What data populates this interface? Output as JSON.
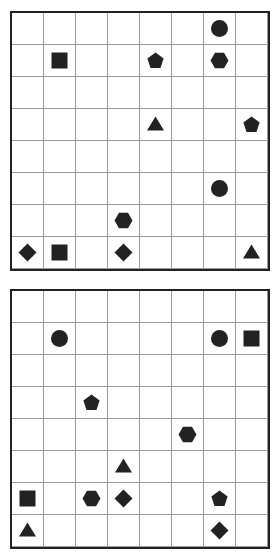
{
  "grid": {
    "rows": 8,
    "cols": 8,
    "cell_px": 32
  },
  "colors": {
    "piece": "#222222",
    "grid_line": "#9a9a9a",
    "border": "#222222",
    "background": "#ffffff"
  },
  "boards": [
    {
      "name": "top-board",
      "pieces": [
        {
          "row": 0,
          "col": 6,
          "shape": "circle"
        },
        {
          "row": 1,
          "col": 1,
          "shape": "square"
        },
        {
          "row": 1,
          "col": 4,
          "shape": "pentagon"
        },
        {
          "row": 1,
          "col": 6,
          "shape": "hexagon"
        },
        {
          "row": 3,
          "col": 4,
          "shape": "triangle"
        },
        {
          "row": 3,
          "col": 7,
          "shape": "pentagon"
        },
        {
          "row": 5,
          "col": 6,
          "shape": "circle"
        },
        {
          "row": 6,
          "col": 3,
          "shape": "hexagon"
        },
        {
          "row": 7,
          "col": 0,
          "shape": "diamond"
        },
        {
          "row": 7,
          "col": 1,
          "shape": "square"
        },
        {
          "row": 7,
          "col": 3,
          "shape": "diamond"
        },
        {
          "row": 7,
          "col": 7,
          "shape": "triangle"
        }
      ]
    },
    {
      "name": "bottom-board",
      "pieces": [
        {
          "row": 1,
          "col": 1,
          "shape": "circle"
        },
        {
          "row": 1,
          "col": 6,
          "shape": "circle"
        },
        {
          "row": 1,
          "col": 7,
          "shape": "square"
        },
        {
          "row": 3,
          "col": 2,
          "shape": "pentagon"
        },
        {
          "row": 4,
          "col": 5,
          "shape": "hexagon"
        },
        {
          "row": 5,
          "col": 3,
          "shape": "triangle"
        },
        {
          "row": 6,
          "col": 0,
          "shape": "square"
        },
        {
          "row": 6,
          "col": 2,
          "shape": "hexagon"
        },
        {
          "row": 6,
          "col": 3,
          "shape": "diamond"
        },
        {
          "row": 6,
          "col": 6,
          "shape": "pentagon"
        },
        {
          "row": 7,
          "col": 0,
          "shape": "triangle"
        },
        {
          "row": 7,
          "col": 6,
          "shape": "diamond"
        }
      ]
    }
  ]
}
